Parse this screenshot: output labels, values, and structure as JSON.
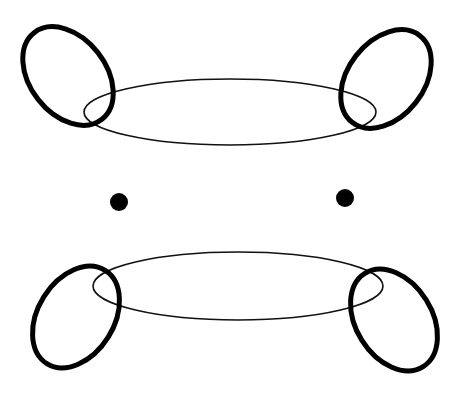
{
  "diagram": {
    "background": "#ffffff",
    "stroke_color": "#111111",
    "top_group": {
      "ring": {
        "cx": 230,
        "cy": 112,
        "rx": 146,
        "ry": 33
      },
      "left_loop": {
        "cx": 68,
        "cy": 76,
        "rx": 38,
        "ry": 55,
        "rotate": -38
      },
      "right_loop": {
        "cx": 386,
        "cy": 79,
        "rx": 38,
        "ry": 55,
        "rotate": 38
      }
    },
    "dots": [
      {
        "cx": 119,
        "cy": 202,
        "r": 9
      },
      {
        "cx": 345,
        "cy": 198,
        "r": 9
      }
    ],
    "bottom_group": {
      "ring": {
        "cx": 238,
        "cy": 286,
        "rx": 145,
        "ry": 34
      },
      "left_loop": {
        "cx": 76,
        "cy": 317,
        "rx": 38,
        "ry": 55,
        "rotate": 32
      },
      "right_loop": {
        "cx": 394,
        "cy": 320,
        "rx": 38,
        "ry": 55,
        "rotate": -32
      }
    }
  }
}
